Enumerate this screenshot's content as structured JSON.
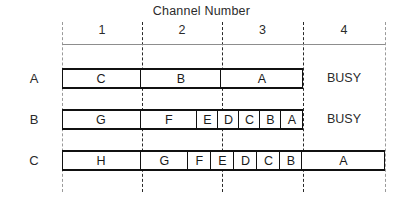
{
  "figure": {
    "title": "Channel Number",
    "channel_labels": [
      "1",
      "2",
      "3",
      "4"
    ],
    "row_labels": [
      "A",
      "B",
      "C"
    ],
    "busy_text": "BUSY"
  },
  "chart_data": {
    "type": "table",
    "title": "Channel Number",
    "xlabel": "Channel Number",
    "ylabel": "",
    "x_categories": [
      "1",
      "2",
      "3",
      "4"
    ],
    "y_categories": [
      "A",
      "B",
      "C"
    ],
    "channel_boundaries_px": [
      62,
      142,
      222,
      303,
      385
    ],
    "rows": [
      {
        "label": "A",
        "segments": [
          {
            "label": "C",
            "start": 62,
            "end": 142
          },
          {
            "label": "B",
            "start": 142,
            "end": 222
          },
          {
            "label": "A",
            "start": 222,
            "end": 303
          }
        ],
        "trailing_status": "BUSY",
        "trailing_status_start": 303,
        "trailing_status_end": 385
      },
      {
        "label": "B",
        "segments": [
          {
            "label": "G",
            "start": 62,
            "end": 142
          },
          {
            "label": "F",
            "start": 142,
            "end": 198
          },
          {
            "label": "E",
            "start": 198,
            "end": 219
          },
          {
            "label": "D",
            "start": 219,
            "end": 240
          },
          {
            "label": "C",
            "start": 240,
            "end": 261
          },
          {
            "label": "B",
            "start": 261,
            "end": 282
          },
          {
            "label": "A",
            "start": 282,
            "end": 303
          }
        ],
        "trailing_status": "BUSY",
        "trailing_status_start": 303,
        "trailing_status_end": 385
      },
      {
        "label": "C",
        "segments": [
          {
            "label": "H",
            "start": 62,
            "end": 142
          },
          {
            "label": "G",
            "start": 142,
            "end": 189
          },
          {
            "label": "F",
            "start": 189,
            "end": 212
          },
          {
            "label": "E",
            "start": 212,
            "end": 235
          },
          {
            "label": "D",
            "start": 235,
            "end": 258
          },
          {
            "label": "C",
            "start": 258,
            "end": 281
          },
          {
            "label": "B",
            "start": 281,
            "end": 303
          },
          {
            "label": "A",
            "start": 303,
            "end": 385
          }
        ],
        "trailing_status": "",
        "trailing_status_start": 0,
        "trailing_status_end": 0
      }
    ],
    "row_geometry": [
      {
        "top": 68,
        "height": 21
      },
      {
        "top": 109,
        "height": 21
      },
      {
        "top": 150,
        "height": 21
      }
    ],
    "grid": {
      "header_rule_y": 44,
      "header_rule_x0": 62,
      "header_rule_x1": 385,
      "vlines_x": [
        62,
        142,
        222,
        303,
        385
      ],
      "vlines_y0": 22,
      "vlines_y1": 192
    },
    "colors": {
      "bar_stroke": "#111111",
      "grid_dash": "#2a2a2a",
      "edge_dash": "#9a9a9a",
      "text": "#1a1a1a",
      "background": "#ffffff"
    }
  }
}
